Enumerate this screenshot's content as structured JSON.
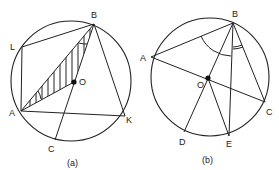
{
  "figures": [
    {
      "caption": "(a)",
      "labels": {
        "B": "B",
        "L": "L",
        "O": "O",
        "A": "A",
        "K": "K",
        "C": "C"
      }
    },
    {
      "caption": "(b)",
      "labels": {
        "B": "B",
        "A": "A",
        "O": "O",
        "C": "C",
        "D": "D",
        "E": "E"
      }
    }
  ],
  "colors": {
    "stroke": "#222222",
    "background": "#ffffff"
  }
}
